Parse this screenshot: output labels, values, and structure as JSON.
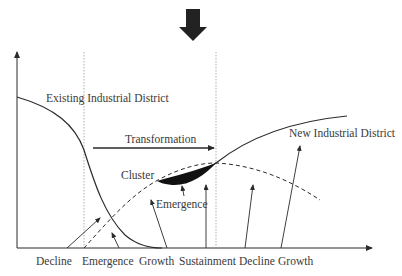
{
  "diagram": {
    "title_arrow": "down-arrow-icon",
    "curves": {
      "existing": {
        "label": "Existing Industrial District"
      },
      "new": {
        "label": "New Industrial District"
      },
      "cluster": {
        "label": "Cluster"
      }
    },
    "annotations": {
      "transformation": "Transformation",
      "emergence": "Emergence"
    },
    "x_axis_stages": [
      "Decline",
      "Emergence",
      "Growth",
      "Sustainment",
      "Decline",
      "Growth"
    ],
    "colors": {
      "line": "#2a2a2a",
      "text": "#3a3a3a",
      "dotted": "#9a9a9a",
      "arrow_fill": "#222222"
    }
  }
}
